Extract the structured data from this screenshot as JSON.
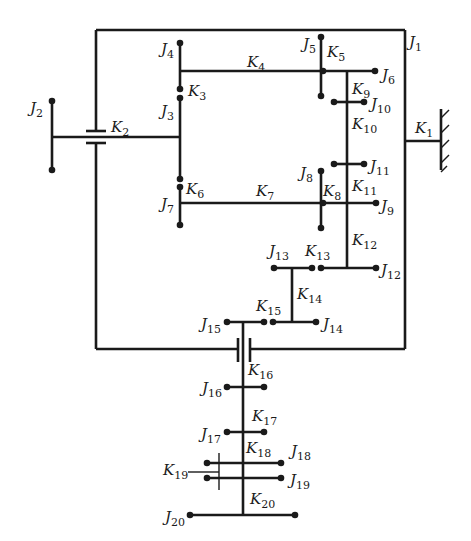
{
  "diagram": {
    "stroke_color": "#1a1a1a",
    "background": "#ffffff",
    "frame": {
      "x1": 96,
      "y1": 30,
      "x2": 405,
      "y2": 349
    },
    "lines": [
      {
        "id": "frame-top",
        "x1": 96,
        "y1": 30,
        "x2": 405,
        "y2": 30
      },
      {
        "id": "frame-right",
        "x1": 405,
        "y1": 30,
        "x2": 405,
        "y2": 349
      },
      {
        "id": "frame-bottom-right",
        "x1": 250,
        "y1": 349,
        "x2": 405,
        "y2": 349
      },
      {
        "id": "frame-bottom-left",
        "x1": 96,
        "y1": 349,
        "x2": 238,
        "y2": 349
      },
      {
        "id": "frame-left-top",
        "x1": 96,
        "y1": 30,
        "x2": 96,
        "y2": 131
      },
      {
        "id": "frame-left-bottom",
        "x1": 96,
        "y1": 143,
        "x2": 96,
        "y2": 349
      },
      {
        "id": "K1-line",
        "x1": 405,
        "y1": 141,
        "x2": 441,
        "y2": 141
      },
      {
        "id": "ground-wall",
        "x1": 441,
        "y1": 109,
        "x2": 441,
        "y2": 170
      },
      {
        "id": "J2-bus",
        "x1": 52,
        "y1": 101,
        "x2": 52,
        "y2": 170
      },
      {
        "id": "K2-line",
        "x1": 52,
        "y1": 137,
        "x2": 180,
        "y2": 137
      },
      {
        "id": "K2-plate-top",
        "x1": 86,
        "y1": 131,
        "x2": 106,
        "y2": 131
      },
      {
        "id": "K2-plate-bottom",
        "x1": 86,
        "y1": 143,
        "x2": 106,
        "y2": 143
      },
      {
        "id": "J4-bus",
        "x1": 180,
        "y1": 43,
        "x2": 180,
        "y2": 89
      },
      {
        "id": "J3-bus",
        "x1": 180,
        "y1": 98,
        "x2": 180,
        "y2": 179
      },
      {
        "id": "J7-bus",
        "x1": 180,
        "y1": 187,
        "x2": 180,
        "y2": 225
      },
      {
        "id": "K4-line",
        "x1": 180,
        "y1": 71,
        "x2": 375,
        "y2": 71
      },
      {
        "id": "J5-bus",
        "x1": 321,
        "y1": 37,
        "x2": 321,
        "y2": 96
      },
      {
        "id": "K9-K12-shaft",
        "x1": 347,
        "y1": 71,
        "x2": 347,
        "y2": 268
      },
      {
        "id": "J10-bar",
        "x1": 334,
        "y1": 102,
        "x2": 364,
        "y2": 102
      },
      {
        "id": "J11-bar",
        "x1": 334,
        "y1": 164,
        "x2": 364,
        "y2": 164
      },
      {
        "id": "K7-line",
        "x1": 180,
        "y1": 203,
        "x2": 376,
        "y2": 203
      },
      {
        "id": "J8-bus",
        "x1": 321,
        "y1": 171,
        "x2": 321,
        "y2": 228
      },
      {
        "id": "J12-bar",
        "x1": 321,
        "y1": 268,
        "x2": 376,
        "y2": 268
      },
      {
        "id": "J13-bar",
        "x1": 274,
        "y1": 268,
        "x2": 312,
        "y2": 268
      },
      {
        "id": "K14-line",
        "x1": 292,
        "y1": 268,
        "x2": 292,
        "y2": 322
      },
      {
        "id": "J14-bar",
        "x1": 273,
        "y1": 322,
        "x2": 316,
        "y2": 322
      },
      {
        "id": "J15-bar",
        "x1": 227,
        "y1": 322,
        "x2": 264,
        "y2": 322
      },
      {
        "id": "main-shaft-top",
        "x1": 243,
        "y1": 322,
        "x2": 243,
        "y2": 515
      },
      {
        "id": "K16-plate-left",
        "x1": 238,
        "y1": 338,
        "x2": 238,
        "y2": 362
      },
      {
        "id": "K16-plate-right",
        "x1": 250,
        "y1": 338,
        "x2": 250,
        "y2": 362
      },
      {
        "id": "J16-bar",
        "x1": 227,
        "y1": 387,
        "x2": 264,
        "y2": 387
      },
      {
        "id": "J17-bar",
        "x1": 227,
        "y1": 432,
        "x2": 264,
        "y2": 432
      },
      {
        "id": "J18-bar",
        "x1": 207,
        "y1": 463,
        "x2": 281,
        "y2": 463
      },
      {
        "id": "J19-bar",
        "x1": 207,
        "y1": 478,
        "x2": 281,
        "y2": 478
      },
      {
        "id": "J20-bar",
        "x1": 190,
        "y1": 515,
        "x2": 295,
        "y2": 515
      }
    ],
    "thin_lines": [
      {
        "id": "K19-bracket",
        "x1": 219,
        "y1": 453,
        "x2": 219,
        "y2": 490
      },
      {
        "id": "K19-leader",
        "x1": 188,
        "y1": 472,
        "x2": 219,
        "y2": 472
      }
    ],
    "ground_hatches": [
      {
        "x1": 441,
        "y1": 118,
        "x2": 449,
        "y2": 110
      },
      {
        "x1": 441,
        "y1": 133,
        "x2": 449,
        "y2": 125
      },
      {
        "x1": 441,
        "y1": 148,
        "x2": 449,
        "y2": 140
      },
      {
        "x1": 441,
        "y1": 163,
        "x2": 449,
        "y2": 155
      },
      {
        "x1": 441,
        "y1": 172,
        "x2": 447,
        "y2": 166
      }
    ],
    "dots": [
      {
        "x": 52,
        "y": 101
      },
      {
        "x": 52,
        "y": 170
      },
      {
        "x": 180,
        "y": 43
      },
      {
        "x": 180,
        "y": 89
      },
      {
        "x": 180,
        "y": 98
      },
      {
        "x": 180,
        "y": 179
      },
      {
        "x": 180,
        "y": 187
      },
      {
        "x": 180,
        "y": 225
      },
      {
        "x": 321,
        "y": 37
      },
      {
        "x": 323,
        "y": 71
      },
      {
        "x": 375,
        "y": 71
      },
      {
        "x": 321,
        "y": 96
      },
      {
        "x": 334,
        "y": 102
      },
      {
        "x": 364,
        "y": 102
      },
      {
        "x": 334,
        "y": 164
      },
      {
        "x": 364,
        "y": 164
      },
      {
        "x": 321,
        "y": 171
      },
      {
        "x": 323,
        "y": 203
      },
      {
        "x": 376,
        "y": 203
      },
      {
        "x": 321,
        "y": 228
      },
      {
        "x": 274,
        "y": 268
      },
      {
        "x": 312,
        "y": 268
      },
      {
        "x": 321,
        "y": 268
      },
      {
        "x": 376,
        "y": 268
      },
      {
        "x": 227,
        "y": 322
      },
      {
        "x": 264,
        "y": 322
      },
      {
        "x": 273,
        "y": 322
      },
      {
        "x": 316,
        "y": 322
      },
      {
        "x": 227,
        "y": 387
      },
      {
        "x": 264,
        "y": 387
      },
      {
        "x": 227,
        "y": 432
      },
      {
        "x": 264,
        "y": 432
      },
      {
        "x": 207,
        "y": 463
      },
      {
        "x": 281,
        "y": 463
      },
      {
        "x": 207,
        "y": 478
      },
      {
        "x": 281,
        "y": 478
      },
      {
        "x": 190,
        "y": 515
      },
      {
        "x": 295,
        "y": 515
      }
    ],
    "labels": [
      {
        "id": "J1",
        "letter": "J",
        "sub": "1",
        "x": 409,
        "y": 47
      },
      {
        "id": "J2",
        "letter": "J",
        "sub": "2",
        "x": 30,
        "y": 113
      },
      {
        "id": "J3",
        "letter": "J",
        "sub": "3",
        "x": 161,
        "y": 116
      },
      {
        "id": "J4",
        "letter": "J",
        "sub": "4",
        "x": 161,
        "y": 54
      },
      {
        "id": "J5",
        "letter": "J",
        "sub": "5",
        "x": 303,
        "y": 49
      },
      {
        "id": "J6",
        "letter": "J",
        "sub": "6",
        "x": 382,
        "y": 80
      },
      {
        "id": "J7",
        "letter": "J",
        "sub": "7",
        "x": 161,
        "y": 209
      },
      {
        "id": "J8",
        "letter": "J",
        "sub": "8",
        "x": 300,
        "y": 178
      },
      {
        "id": "J9",
        "letter": "J",
        "sub": "9",
        "x": 381,
        "y": 211
      },
      {
        "id": "J10",
        "letter": "J",
        "sub": "10",
        "x": 371,
        "y": 109
      },
      {
        "id": "J11",
        "letter": "J",
        "sub": "11",
        "x": 370,
        "y": 171
      },
      {
        "id": "J12",
        "letter": "J",
        "sub": "12",
        "x": 381,
        "y": 275
      },
      {
        "id": "J13",
        "letter": "J",
        "sub": "13",
        "x": 269,
        "y": 256
      },
      {
        "id": "J14",
        "letter": "J",
        "sub": "14",
        "x": 323,
        "y": 329
      },
      {
        "id": "J15",
        "letter": "J",
        "sub": "15",
        "x": 201,
        "y": 329
      },
      {
        "id": "J16",
        "letter": "J",
        "sub": "16",
        "x": 202,
        "y": 393
      },
      {
        "id": "J17",
        "letter": "J",
        "sub": "17",
        "x": 201,
        "y": 439
      },
      {
        "id": "J18",
        "letter": "J",
        "sub": "18",
        "x": 291,
        "y": 456
      },
      {
        "id": "J19",
        "letter": "J",
        "sub": "19",
        "x": 290,
        "y": 485
      },
      {
        "id": "J20",
        "letter": "J",
        "sub": "20",
        "x": 165,
        "y": 522
      },
      {
        "id": "K1",
        "letter": "K",
        "sub": "1",
        "x": 415,
        "y": 133
      },
      {
        "id": "K2",
        "letter": "K",
        "sub": "2",
        "x": 111,
        "y": 132
      },
      {
        "id": "K3",
        "letter": "K",
        "sub": "3",
        "x": 188,
        "y": 96
      },
      {
        "id": "K4",
        "letter": "K",
        "sub": "4",
        "x": 247,
        "y": 67
      },
      {
        "id": "K5",
        "letter": "K",
        "sub": "5",
        "x": 327,
        "y": 57
      },
      {
        "id": "K6",
        "letter": "K",
        "sub": "6",
        "x": 186,
        "y": 194
      },
      {
        "id": "K7",
        "letter": "K",
        "sub": "7",
        "x": 256,
        "y": 196
      },
      {
        "id": "K8",
        "letter": "K",
        "sub": "8",
        "x": 323,
        "y": 196
      },
      {
        "id": "K9",
        "letter": "K",
        "sub": "9",
        "x": 352,
        "y": 94
      },
      {
        "id": "K10",
        "letter": "K",
        "sub": "10",
        "x": 352,
        "y": 129
      },
      {
        "id": "K11",
        "letter": "K",
        "sub": "11",
        "x": 352,
        "y": 191
      },
      {
        "id": "K12",
        "letter": "K",
        "sub": "12",
        "x": 352,
        "y": 245
      },
      {
        "id": "K13",
        "letter": "K",
        "sub": "13",
        "x": 305,
        "y": 256
      },
      {
        "id": "K14",
        "letter": "K",
        "sub": "14",
        "x": 297,
        "y": 299
      },
      {
        "id": "K15",
        "letter": "K",
        "sub": "15",
        "x": 256,
        "y": 311
      },
      {
        "id": "K16",
        "letter": "K",
        "sub": "16",
        "x": 248,
        "y": 375
      },
      {
        "id": "K17",
        "letter": "K",
        "sub": "17",
        "x": 252,
        "y": 421
      },
      {
        "id": "K18",
        "letter": "K",
        "sub": "18",
        "x": 246,
        "y": 453
      },
      {
        "id": "K19",
        "letter": "K",
        "sub": "19",
        "x": 163,
        "y": 475
      },
      {
        "id": "K20",
        "letter": "K",
        "sub": "20",
        "x": 250,
        "y": 504
      }
    ]
  }
}
